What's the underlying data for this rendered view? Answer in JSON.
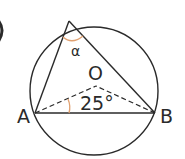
{
  "diagram": {
    "type": "inscribed-triangle-circle",
    "points": {
      "A": {
        "label": "A"
      },
      "B": {
        "label": "B"
      },
      "O": {
        "label": "O"
      }
    },
    "angles": {
      "alpha": {
        "label": "α",
        "vertex": "top"
      },
      "OAB": {
        "label": "25°",
        "value": 25
      }
    },
    "colors": {
      "stroke": "#2a2a2a",
      "angle_arc": "#e0a070"
    }
  }
}
